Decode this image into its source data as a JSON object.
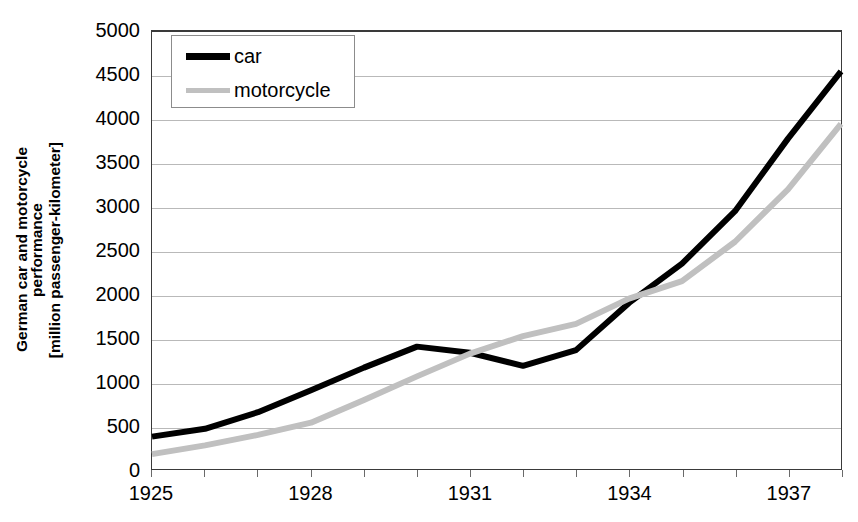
{
  "chart_data": {
    "type": "line",
    "title": "",
    "xlabel": "",
    "ylabel": "German car and motorcycle performance [million passenger-kilometer]",
    "ylabel_lines": [
      "German car and motorcycle",
      "performance",
      "[million passenger-kilometer]"
    ],
    "x": [
      1925,
      1926,
      1927,
      1928,
      1929,
      1930,
      1931,
      1932,
      1933,
      1934,
      1935,
      1936,
      1937,
      1938
    ],
    "xlim": [
      1925,
      1938
    ],
    "ylim": [
      0,
      5000
    ],
    "y_ticks": [
      0,
      500,
      1000,
      1500,
      2000,
      2500,
      3000,
      3500,
      4000,
      4500,
      5000
    ],
    "y_tick_labels": [
      "0",
      "500",
      "1000",
      "1500",
      "2000",
      "2500",
      "3000",
      "3500",
      "4000",
      "4500",
      "5000"
    ],
    "x_ticks_major": [
      1925,
      1928,
      1931,
      1934,
      1937
    ],
    "x_tick_labels": [
      "1925",
      "1928",
      "1931",
      "1934",
      "1937"
    ],
    "grid": true,
    "grid_axis": "y",
    "legend_position": "top-left",
    "series": [
      {
        "name": "car",
        "color": "#000000",
        "width": 6,
        "values": [
          370,
          460,
          650,
          900,
          1160,
          1400,
          1330,
          1180,
          1360,
          1900,
          2350,
          2950,
          3780,
          4550
        ]
      },
      {
        "name": "motorcycle",
        "color": "#c0c0c0",
        "width": 6,
        "values": [
          170,
          270,
          390,
          530,
          790,
          1060,
          1320,
          1520,
          1660,
          1950,
          2150,
          2600,
          3200,
          3950
        ]
      }
    ]
  },
  "legend": {
    "items": [
      {
        "label": "car",
        "key": "car"
      },
      {
        "label": "motorcycle",
        "key": "motorcycle"
      }
    ]
  },
  "colors": {
    "car": "#000000",
    "motorcycle": "#c0c0c0",
    "grid": "#b9b9b9",
    "axis": "#3a3a3a",
    "background": "#ffffff"
  }
}
